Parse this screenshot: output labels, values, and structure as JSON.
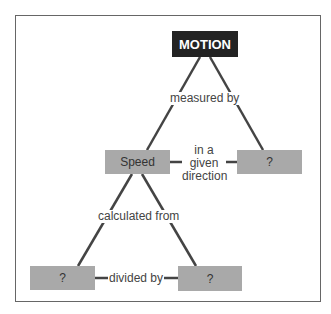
{
  "diagram": {
    "type": "concept-map",
    "colors": {
      "root_fill": "#232323",
      "root_text": "#ffffff",
      "node_fill": "#a9a9a9",
      "node_text": "#333333",
      "line": "#444444",
      "frame": "#666666"
    },
    "nodes": {
      "root": {
        "label": "MOTION"
      },
      "speed": {
        "label": "Speed"
      },
      "velocity": {
        "label": "?"
      },
      "distance": {
        "label": "?"
      },
      "time": {
        "label": "?"
      }
    },
    "links": {
      "measured_by": {
        "label": "measured by",
        "from": "MOTION",
        "to": [
          "Speed",
          "?"
        ]
      },
      "direction": {
        "line1": "in a",
        "line2": "given",
        "line3": "direction",
        "from": "Speed",
        "to": "?"
      },
      "calculated_from": {
        "label": "calculated from",
        "from": "Speed",
        "to": [
          "?",
          "?"
        ]
      },
      "divided_by": {
        "label": "divided by",
        "from": "?",
        "to": "?"
      }
    }
  }
}
